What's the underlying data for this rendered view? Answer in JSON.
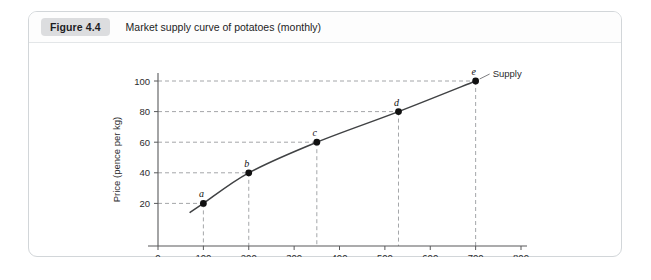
{
  "figure": {
    "badge": "Figure 4.4",
    "title": "Market supply curve of potatoes (monthly)"
  },
  "chart_data": {
    "type": "line",
    "title": "Market supply curve of potatoes (monthly)",
    "xlabel": "Quantity (tonnes: 000s)",
    "ylabel": "Price (pence per kg)",
    "xlim": [
      0,
      800
    ],
    "ylim": [
      0,
      110
    ],
    "grid": false,
    "legend_position": "right-of-endpoint",
    "series": [
      {
        "name": "Supply",
        "points": [
          {
            "label": "a",
            "x": 100,
            "y": 20
          },
          {
            "label": "b",
            "x": 200,
            "y": 40
          },
          {
            "label": "c",
            "x": 350,
            "y": 60
          },
          {
            "label": "d",
            "x": 530,
            "y": 80
          },
          {
            "label": "e",
            "x": 700,
            "y": 100
          }
        ]
      }
    ],
    "xticks": [
      0,
      100,
      200,
      300,
      400,
      500,
      600,
      700,
      800
    ],
    "xtick_labels": [
      "0",
      "100",
      "200",
      "300",
      "400",
      "500",
      "600",
      "700",
      "800"
    ],
    "yticks": [
      20,
      40,
      60,
      80,
      100
    ],
    "ytick_labels": [
      "20",
      "40",
      "60",
      "80",
      "100"
    ],
    "annotations": [
      {
        "text": "Supply",
        "at_point": "e"
      }
    ],
    "guide_lines": "dashed drop-lines from each point to both axes",
    "colors": {
      "curve": "#404244",
      "dot": "#111111",
      "axis": "#58595b",
      "dash": "#9a9c9f"
    }
  }
}
